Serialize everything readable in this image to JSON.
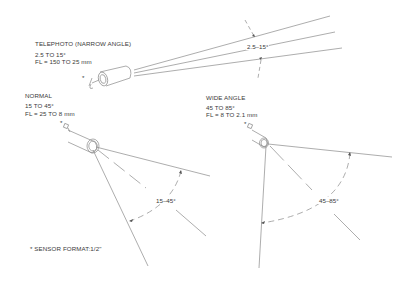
{
  "telephoto": {
    "title": "TELEPHOTO (NARROW ANGLE)",
    "range": "2.5 TO 15°",
    "focal_length": "FL = 150 TO 25 mm",
    "angle_label": "2.5–15°",
    "sensor_mark": "*"
  },
  "normal": {
    "title": "NORMAL",
    "range": "15 TO 45°",
    "focal_length": "FL = 25 TO 8 mm",
    "angle_label": "15–45°",
    "sensor_mark": "*"
  },
  "wide": {
    "title": "WIDE ANGLE",
    "range": "45 TO 85°",
    "focal_length": "FL = 8 TO 2.1 mm",
    "angle_label": "45–85°",
    "sensor_mark": "*"
  },
  "footnote": "* SENSOR FORMAT:1/2\"",
  "colors": {
    "line": "#8a8a8a",
    "text": "#3a3a3a",
    "background": "#ffffff"
  }
}
